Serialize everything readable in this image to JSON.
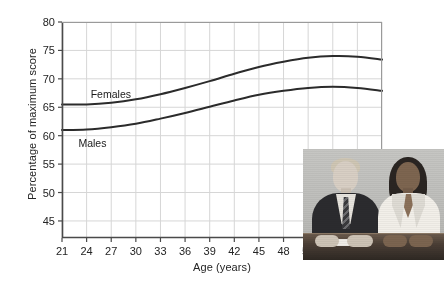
{
  "chart_data": {
    "type": "line",
    "title": "",
    "xlabel": "Age (years)",
    "ylabel": "Percentage of maximum score",
    "xlim": [
      21,
      60
    ],
    "ylim": [
      42,
      80
    ],
    "xticks": [
      21,
      24,
      27,
      30,
      33,
      36,
      39,
      42,
      45,
      48,
      51,
      54,
      57,
      60
    ],
    "yticks": [
      45,
      50,
      55,
      60,
      65,
      70,
      75,
      80
    ],
    "grid": true,
    "legend_position": "inline-annotations",
    "annotations": [
      {
        "text": "Females",
        "x": 24.5,
        "y": 67.3
      },
      {
        "text": "Males",
        "x": 23.0,
        "y": 58.7
      }
    ],
    "x": [
      21,
      24,
      27,
      30,
      33,
      36,
      39,
      42,
      45,
      48,
      51,
      54,
      57,
      60
    ],
    "series": [
      {
        "name": "Females",
        "color": "#2b2b2b",
        "values": [
          65.5,
          65.5,
          65.8,
          66.4,
          67.3,
          68.4,
          69.6,
          70.9,
          72.1,
          73.0,
          73.7,
          74.0,
          73.9,
          73.4
        ]
      },
      {
        "name": "Males",
        "color": "#2b2b2b",
        "values": [
          61.0,
          61.1,
          61.5,
          62.1,
          63.0,
          64.0,
          65.1,
          66.2,
          67.2,
          67.9,
          68.4,
          68.6,
          68.4,
          67.9
        ]
      }
    ],
    "inset_image": {
      "caption": "photograph of a man in a dark suit and a woman in a white blazer seated at a desk",
      "alt": "seated-couple-photo"
    }
  }
}
